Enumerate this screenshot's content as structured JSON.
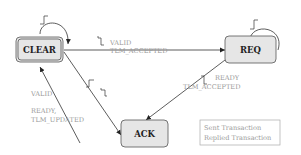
{
  "diagram": {
    "type": "state-machine",
    "states": [
      {
        "id": "clear",
        "label": "CLEAR",
        "initial": true
      },
      {
        "id": "req",
        "label": "REQ",
        "initial": false
      },
      {
        "id": "ack",
        "label": "ACK",
        "initial": false
      }
    ],
    "transitions": [
      {
        "from": "clear",
        "to": "clear",
        "label": "",
        "trigger": "clock-edge"
      },
      {
        "from": "clear",
        "to": "req",
        "label_line1": "VALID",
        "label_line2": "TLM_ACCEPTED",
        "trigger": "clock-edge"
      },
      {
        "from": "req",
        "to": "req",
        "label": "",
        "trigger": "clock-edge"
      },
      {
        "from": "req",
        "to": "ack",
        "label_line1": "READY",
        "label_line2": "TLM_ACCEPTED",
        "trigger": "clock-edge"
      },
      {
        "from": "clear",
        "to": "ack",
        "label_line1": "VALID",
        "trigger": "clock-edge"
      },
      {
        "from": "ack",
        "to": "clear",
        "label_line1": "READY,",
        "label_line2": "TLM_UPDATED",
        "trigger": "clock-edge"
      }
    ],
    "legend": {
      "items": [
        "Sent Transaction",
        "Replied Transaction"
      ]
    }
  }
}
